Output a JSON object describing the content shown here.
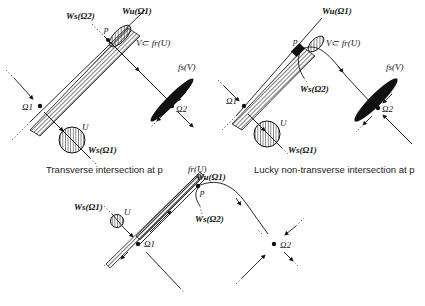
{
  "panels": [
    {
      "id": "transverse",
      "caption": "Transverse intersection at p",
      "labels": {
        "ws_omega2": "Ws(Ω2)",
        "wu_omega1": "Wu(Ω1)",
        "p": "p",
        "vc": "V⊂ fr(U)",
        "fs_v": "fs(V)",
        "omega1": "Ω1",
        "omega2": "Ω2",
        "u": "U",
        "ws_omega1": "Ws(Ω1)"
      }
    },
    {
      "id": "lucky",
      "caption": "Lucky non-transverse intersection at p",
      "labels": {
        "wu_omega1": "Wu(Ω1)",
        "p": "p",
        "vc": "V⊂ fr(U)",
        "ws_omega2": "Ws(Ω2)",
        "fs_v": "fs(V)",
        "omega1": "Ω1",
        "omega2": "Ω2",
        "u": "U",
        "ws_omega1": "Ws(Ω1)"
      }
    },
    {
      "id": "nontransverse",
      "caption": "",
      "labels": {
        "fr_u": "fr(U)",
        "wu_omega1": "Wu(Ω1)",
        "p": "p",
        "ws_omega1": "Ws(Ω1)",
        "u": "U",
        "ws_omega2": "Ws(Ω2)",
        "omega1": "Ω1",
        "omega2": "Ω2"
      }
    }
  ]
}
